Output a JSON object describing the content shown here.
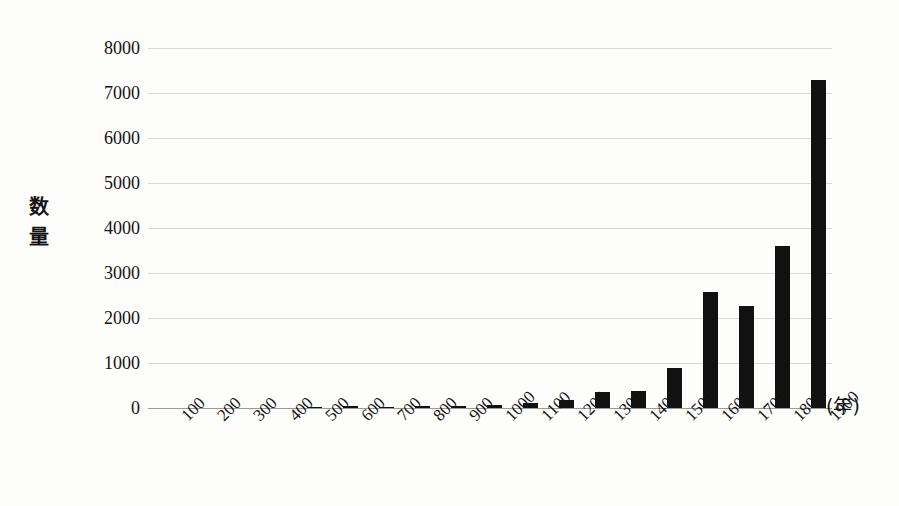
{
  "chart_data": {
    "type": "bar",
    "title": "",
    "subtitle": "",
    "xlabel": "(年)",
    "ylabel": "数量",
    "categories": [
      "100",
      "200",
      "300",
      "400",
      "500",
      "600",
      "700",
      "800",
      "900",
      "1000",
      "1100",
      "1200",
      "1300",
      "1400",
      "1500",
      "1600",
      "1700",
      "1800",
      "1900"
    ],
    "values": [
      0,
      0,
      0,
      0,
      30,
      40,
      30,
      35,
      55,
      70,
      120,
      170,
      360,
      380,
      890,
      2570,
      2260,
      3600,
      7280
    ],
    "ylim": [
      0,
      8000
    ],
    "ytick_labels": [
      "8000",
      "7000",
      "6000",
      "5000",
      "4000",
      "3000",
      "2000",
      "1000",
      "0"
    ],
    "ytick_values": [
      8000,
      7000,
      6000,
      5000,
      4000,
      3000,
      2000,
      1000,
      0
    ],
    "grid": true,
    "legend": null,
    "legend_position": "none",
    "bar_color": "#111111",
    "gridline_color": "#d8d8d8",
    "axis_color": "#9a9a9a",
    "background_color": "#fdfdfc"
  },
  "axes": {
    "y_title_chars": [
      "数",
      "量"
    ],
    "x_unit": "(年)"
  }
}
